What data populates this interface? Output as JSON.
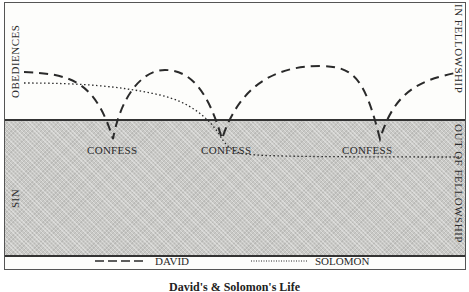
{
  "diagram": {
    "labels": {
      "top_left_vertical": "OBEDIENCES",
      "bottom_left_vertical": "SIN",
      "top_right_vertical": "IN FELLOWSHIP",
      "bottom_right_vertical": "OUT OF FELLOWSHIP"
    },
    "confess_labels": [
      "CONFESS",
      "CONFESS",
      "CONFESS"
    ],
    "legend": {
      "david": "DAVID",
      "solomon": "SOLOMON"
    },
    "series": [
      {
        "name": "DAVID",
        "style": "dashed",
        "description": "Dips below the line to confess three times, then returns to fellowship each time"
      },
      {
        "name": "SOLOMON",
        "style": "dotted",
        "description": "Declines gradually, dips at the second confess point and remains out of fellowship"
      }
    ],
    "caption": "David's & Solomon's Life"
  },
  "colors": {
    "line": "#2a2a2a",
    "sin_zone": "#c9c9c6",
    "border": "#333333"
  }
}
